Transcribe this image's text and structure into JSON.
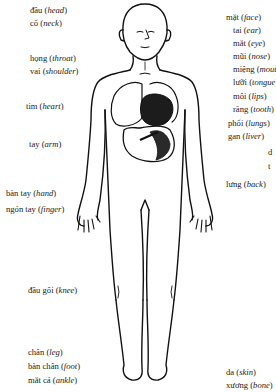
{
  "diagram": {
    "left_labels": [
      {
        "vi": "đầu",
        "en": "head",
        "x": 30,
        "y": 5
      },
      {
        "vi": "cổ",
        "en": "neck",
        "x": 30,
        "y": 18
      },
      {
        "vi": "họng",
        "en": "throat",
        "x": 30,
        "y": 53
      },
      {
        "vi": "vai",
        "en": "shoulder",
        "x": 30,
        "y": 66
      },
      {
        "vi": "tim",
        "en": "heart",
        "x": 26,
        "y": 101
      },
      {
        "vi": "tay",
        "en": "arm",
        "x": 29,
        "y": 139
      },
      {
        "vi": "bàn tay",
        "en": "hand",
        "x": 6,
        "y": 188
      },
      {
        "vi": "ngón tay",
        "en": "finger",
        "x": 6,
        "y": 204
      },
      {
        "vi": "đầu gối",
        "en": "knee",
        "x": 28,
        "y": 285
      },
      {
        "vi": "chân",
        "en": "leg",
        "x": 28,
        "y": 347
      },
      {
        "vi": "bàn chân",
        "en": "foot",
        "x": 28,
        "y": 361
      },
      {
        "vi": "mắt cá",
        "en": "ankle",
        "x": 28,
        "y": 375
      }
    ],
    "right_labels": [
      {
        "vi": "mặt",
        "en": "face",
        "x": 226,
        "y": 12
      },
      {
        "vi": "tai",
        "en": "ear",
        "x": 233,
        "y": 25
      },
      {
        "vi": "mắt",
        "en": "eye",
        "x": 233,
        "y": 38
      },
      {
        "vi": "mũi",
        "en": "nose",
        "x": 233,
        "y": 51
      },
      {
        "vi": "miệng",
        "en": "mouth",
        "x": 233,
        "y": 64
      },
      {
        "vi": "lưỡi",
        "en": "tongue",
        "x": 233,
        "y": 77
      },
      {
        "vi": "môi",
        "en": "lips",
        "x": 233,
        "y": 91
      },
      {
        "vi": "răng",
        "en": "tooth",
        "x": 233,
        "y": 104
      },
      {
        "vi": "phổi",
        "en": "lungs",
        "x": 228,
        "y": 118
      },
      {
        "vi": "gan",
        "en": "liver",
        "x": 228,
        "y": 131
      },
      {
        "vi": "d",
        "en": "",
        "x": 268,
        "y": 147
      },
      {
        "vi": "t",
        "en": "",
        "x": 268,
        "y": 161
      },
      {
        "vi": "lưng",
        "en": "back",
        "x": 226,
        "y": 179
      },
      {
        "vi": "da",
        "en": "skin",
        "x": 226,
        "y": 367
      },
      {
        "vi": "xương",
        "en": "bone",
        "x": 226,
        "y": 380
      }
    ]
  }
}
